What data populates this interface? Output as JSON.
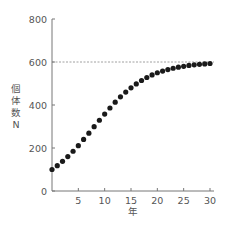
{
  "chart_data": {
    "type": "scatter",
    "title": "",
    "xlabel": "年",
    "ylabel": "個体数 N",
    "ylabel_chars": [
      "個",
      "体",
      "数",
      "N"
    ],
    "x_ticks": [
      5,
      10,
      15,
      20,
      25,
      30
    ],
    "y_ticks": [
      0,
      200,
      400,
      600,
      800
    ],
    "xlim": [
      0,
      30
    ],
    "ylim": [
      0,
      800
    ],
    "grid": false,
    "reference_line": {
      "y": 600,
      "style": "dashed"
    },
    "series": [
      {
        "name": "個体数",
        "x": [
          0,
          1,
          2,
          3,
          4,
          5,
          6,
          7,
          8,
          9,
          10,
          11,
          12,
          13,
          14,
          15,
          16,
          17,
          18,
          19,
          20,
          21,
          22,
          23,
          24,
          25,
          26,
          27,
          28,
          29,
          30
        ],
        "values": [
          100,
          118,
          138,
          160,
          185,
          211,
          240,
          269,
          299,
          329,
          358,
          386,
          413,
          438,
          460,
          480,
          498,
          514,
          528,
          540,
          550,
          558,
          565,
          571,
          576,
          580,
          584,
          587,
          589,
          591,
          593
        ]
      }
    ]
  },
  "colors": {
    "axis": "#777777",
    "points": "#1a1a1a",
    "reference_line": "#888888",
    "text": "#555555"
  }
}
